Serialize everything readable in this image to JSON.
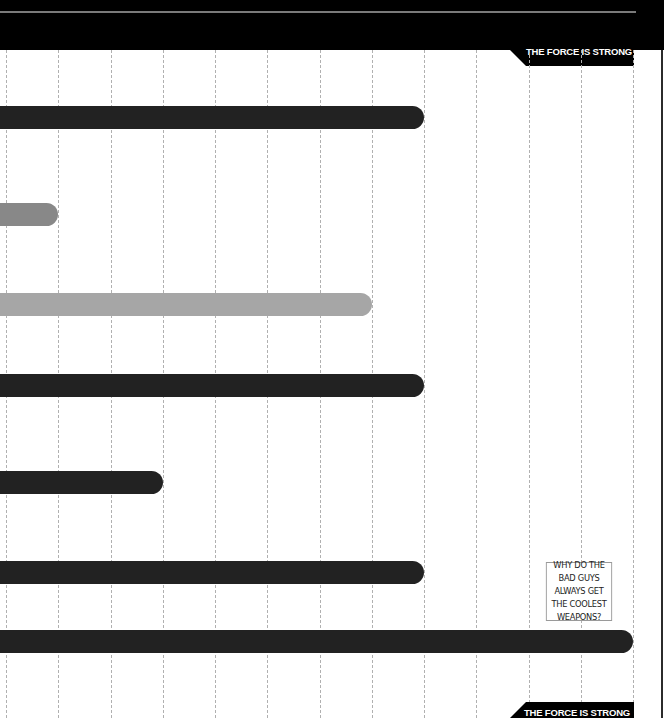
{
  "header": {
    "banner_label": "THE FORCE IS STRONG"
  },
  "footer": {
    "banner_label": "THE FORCE IS STRONG"
  },
  "callout": {
    "text": "WHY DO THE BAD GUYS ALWAYS GET THE COOLEST WEAPONS?"
  },
  "colors": {
    "dark_bar": "#222222",
    "gray_bar": "#888888",
    "light_gray_bar": "#a6a6a6",
    "grid": "#b0b0b0",
    "banner": "#000000"
  },
  "chart_data": {
    "type": "bar",
    "orientation": "horizontal",
    "title": "",
    "xlabel": "",
    "ylabel": "",
    "categories": [
      "Bar 1",
      "Bar 2",
      "Bar 3",
      "Bar 4",
      "Bar 5",
      "Bar 6",
      "Bar 7"
    ],
    "values": [
      8,
      1,
      7,
      8,
      3,
      8,
      12
    ],
    "bar_colors": [
      "#222222",
      "#888888",
      "#a6a6a6",
      "#222222",
      "#222222",
      "#222222",
      "#222222"
    ],
    "xlim": [
      0,
      12
    ],
    "grid": true,
    "grid_style": "dashed vertical",
    "grid_count": 13,
    "tick_labels_visible": false,
    "annotations": [
      "WHY DO THE BAD GUYS ALWAYS GET THE COOLEST WEAPONS?"
    ]
  }
}
